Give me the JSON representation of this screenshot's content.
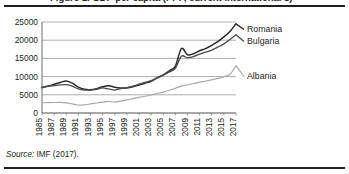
{
  "figure": {
    "title": "Figure 1. GDP per capita (PPP, current international $)",
    "source_label": "Source:",
    "source_text": " IMF (2017)."
  },
  "chart_data": {
    "type": "line",
    "title": "",
    "xlabel": "",
    "ylabel": "",
    "ylim": [
      0,
      25000
    ],
    "ytick_values": [
      0,
      5000,
      10000,
      15000,
      20000,
      25000
    ],
    "ytick_labels": [
      "0",
      "5000",
      "10000",
      "15000",
      "20000",
      "25000"
    ],
    "grid": true,
    "legend_position": "inline-right",
    "x": [
      1985,
      1986,
      1987,
      1988,
      1989,
      1990,
      1991,
      1992,
      1993,
      1994,
      1995,
      1996,
      1997,
      1998,
      1999,
      2000,
      2001,
      2002,
      2003,
      2004,
      2005,
      2006,
      2007,
      2008,
      2009,
      2010,
      2011,
      2012,
      2013,
      2014,
      2015,
      2016,
      2017
    ],
    "xtick_labels": [
      "1985",
      "1987",
      "1989",
      "1991",
      "1993",
      "1995",
      "1997",
      "1999",
      "2001",
      "2003",
      "2005",
      "2007",
      "2009",
      "2011",
      "2013",
      "2015",
      "2017"
    ],
    "series": [
      {
        "name": "Romania",
        "color": "#2b2b2b",
        "width": 1.5,
        "values": [
          7000,
          7400,
          7900,
          8400,
          8800,
          8200,
          7100,
          6500,
          6400,
          6700,
          7200,
          7500,
          7100,
          6900,
          6900,
          7200,
          7700,
          8200,
          8700,
          9700,
          10500,
          11600,
          12900,
          17700,
          16000,
          16300,
          17100,
          17700,
          18600,
          19600,
          20900,
          22400,
          24500
        ]
      },
      {
        "name": "Bulgaria",
        "color": "#4a4a4a",
        "width": 1.3,
        "values": [
          7000,
          7300,
          7500,
          7700,
          7800,
          7400,
          6600,
          6300,
          6300,
          6500,
          6900,
          6600,
          6300,
          6700,
          7000,
          7400,
          7900,
          8400,
          8900,
          9600,
          10400,
          11300,
          12300,
          15600,
          15200,
          15500,
          16200,
          16700,
          17300,
          18100,
          19000,
          20200,
          21500
        ]
      },
      {
        "name": "Albania",
        "color": "#a8a8a8",
        "width": 1.2,
        "values": [
          2800,
          2850,
          2880,
          2900,
          2800,
          2500,
          2200,
          2250,
          2500,
          2750,
          3000,
          3200,
          3000,
          3250,
          3600,
          3950,
          4300,
          4600,
          4950,
          5350,
          5750,
          6250,
          6800,
          7400,
          7700,
          8100,
          8500,
          8800,
          9100,
          9500,
          10000,
          10600,
          13000
        ]
      }
    ]
  }
}
